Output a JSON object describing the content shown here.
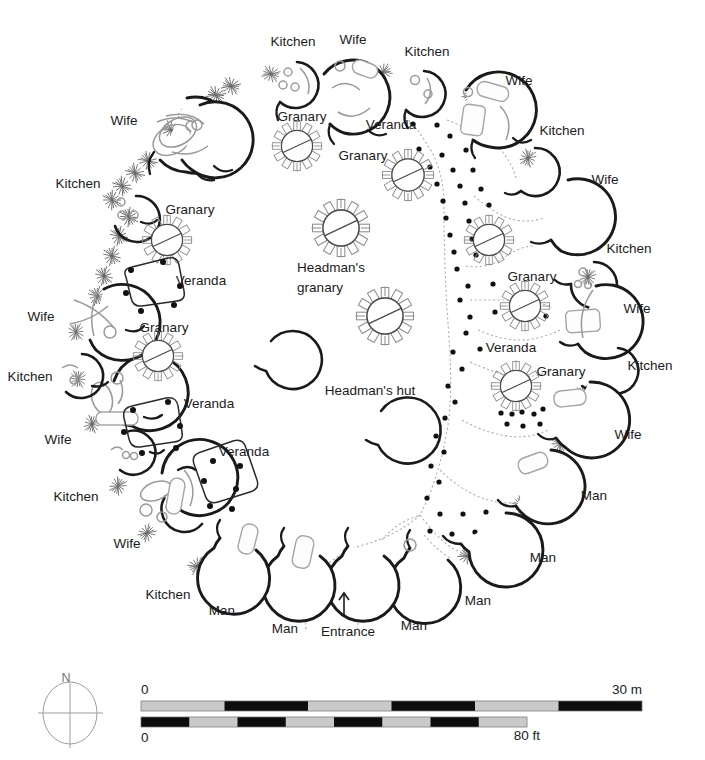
{
  "figure": {
    "type": "site-plan",
    "orientation_label": "N"
  },
  "labels": [
    {
      "id": "l01",
      "text": "Kitchen",
      "x": 293,
      "y": 42,
      "anchor": "middle"
    },
    {
      "id": "l02",
      "text": "Wife",
      "x": 353,
      "y": 40,
      "anchor": "middle"
    },
    {
      "id": "l03",
      "text": "Kitchen",
      "x": 427,
      "y": 52,
      "anchor": "middle"
    },
    {
      "id": "l04",
      "text": "Wife",
      "x": 519,
      "y": 81,
      "anchor": "middle"
    },
    {
      "id": "l05",
      "text": "Kitchen",
      "x": 562,
      "y": 131,
      "anchor": "middle"
    },
    {
      "id": "l06",
      "text": "Wife",
      "x": 605,
      "y": 180,
      "anchor": "middle"
    },
    {
      "id": "l07",
      "text": "Kitchen",
      "x": 629,
      "y": 249,
      "anchor": "middle"
    },
    {
      "id": "l08",
      "text": "Wife",
      "x": 637,
      "y": 309,
      "anchor": "middle"
    },
    {
      "id": "l09",
      "text": "Kitchen",
      "x": 650,
      "y": 366,
      "anchor": "middle"
    },
    {
      "id": "l10",
      "text": "Wife",
      "x": 628,
      "y": 435,
      "anchor": "middle"
    },
    {
      "id": "l11",
      "text": "Man",
      "x": 594,
      "y": 496,
      "anchor": "middle"
    },
    {
      "id": "l12",
      "text": "Man",
      "x": 543,
      "y": 558,
      "anchor": "middle"
    },
    {
      "id": "l13",
      "text": "Man",
      "x": 478,
      "y": 601,
      "anchor": "middle"
    },
    {
      "id": "l14",
      "text": "Man",
      "x": 414,
      "y": 626,
      "anchor": "middle"
    },
    {
      "id": "l15",
      "text": "Man",
      "x": 285,
      "y": 629,
      "anchor": "middle"
    },
    {
      "id": "l16",
      "text": "Man",
      "x": 222,
      "y": 611,
      "anchor": "middle"
    },
    {
      "id": "l17",
      "text": "Kitchen",
      "x": 168,
      "y": 595,
      "anchor": "middle"
    },
    {
      "id": "l18",
      "text": "Wife",
      "x": 127,
      "y": 544,
      "anchor": "middle"
    },
    {
      "id": "l19",
      "text": "Kitchen",
      "x": 76,
      "y": 497,
      "anchor": "middle"
    },
    {
      "id": "l20",
      "text": "Wife",
      "x": 58,
      "y": 440,
      "anchor": "middle"
    },
    {
      "id": "l21",
      "text": "Kitchen",
      "x": 30,
      "y": 377,
      "anchor": "middle"
    },
    {
      "id": "l22",
      "text": "Wife",
      "x": 41,
      "y": 317,
      "anchor": "middle"
    },
    {
      "id": "l23",
      "text": "Kitchen",
      "x": 78,
      "y": 184,
      "anchor": "middle"
    },
    {
      "id": "l24",
      "text": "Wife",
      "x": 124,
      "y": 121,
      "anchor": "middle"
    },
    {
      "id": "l25",
      "text": "Granary",
      "x": 302,
      "y": 117,
      "anchor": "middle"
    },
    {
      "id": "l26",
      "text": "Granary",
      "x": 363,
      "y": 156,
      "anchor": "middle"
    },
    {
      "id": "l27",
      "text": "Granary",
      "x": 190,
      "y": 210,
      "anchor": "middle"
    },
    {
      "id": "l28",
      "text": "Granary",
      "x": 164,
      "y": 328,
      "anchor": "middle"
    },
    {
      "id": "l29",
      "text": "Granary",
      "x": 532,
      "y": 277,
      "anchor": "middle"
    },
    {
      "id": "l30",
      "text": "Granary",
      "x": 561,
      "y": 372,
      "anchor": "middle"
    },
    {
      "id": "l31",
      "text": "Veranda",
      "x": 391,
      "y": 125,
      "anchor": "middle"
    },
    {
      "id": "l32",
      "text": "Veranda",
      "x": 201,
      "y": 281,
      "anchor": "middle"
    },
    {
      "id": "l33",
      "text": "Veranda",
      "x": 209,
      "y": 404,
      "anchor": "middle"
    },
    {
      "id": "l34",
      "text": "Veranda",
      "x": 244,
      "y": 452,
      "anchor": "middle"
    },
    {
      "id": "l35",
      "text": "Veranda",
      "x": 511,
      "y": 348,
      "anchor": "middle"
    },
    {
      "id": "l36",
      "text": "Headman's",
      "x": 331,
      "y": 268,
      "anchor": "middle"
    },
    {
      "id": "l37",
      "text": "granary",
      "x": 320,
      "y": 288,
      "anchor": "middle"
    },
    {
      "id": "l38",
      "text": "Headman's hut",
      "x": 370,
      "y": 391,
      "anchor": "middle"
    },
    {
      "id": "l39",
      "text": "Entrance",
      "x": 348,
      "y": 632,
      "anchor": "middle"
    }
  ],
  "scale": {
    "metric": {
      "start_label": "0",
      "end_label": "30 m",
      "segments": 6,
      "total": 30,
      "unit": "m"
    },
    "imperial": {
      "start_label": "0",
      "end_label": "80 ft",
      "segments": 8,
      "total": 80,
      "unit": "ft"
    }
  },
  "compass": {
    "north_label": "N"
  },
  "colors": {
    "hut_wall": "#1a1a1a",
    "granary": "#4a4a4a",
    "interior_feature": "#9a9a9a",
    "post": "#111111",
    "path": "#b0b0b0",
    "scale_dark": "#0d0d0d",
    "scale_light": "#c9c9c9"
  }
}
